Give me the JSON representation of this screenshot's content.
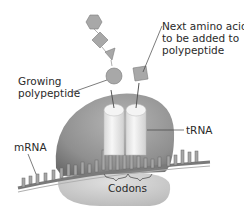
{
  "diagram": {
    "labels": {
      "next_amino_acid": [
        "Next amino acid",
        "to be added to",
        "polypeptide"
      ],
      "growing_polypeptide": [
        "Growing",
        "polypeptide"
      ],
      "trna": "tRNA",
      "mrna": "mRNA",
      "codons": "Codons"
    },
    "colors": {
      "ribosome_large": "#8f8f8f",
      "ribosome_small": "#c4c4c4",
      "trna": "#ededed",
      "amino_acid": "#a8a8a8",
      "mrna": "#9a9a9a",
      "text": "#2a2a2a"
    }
  }
}
